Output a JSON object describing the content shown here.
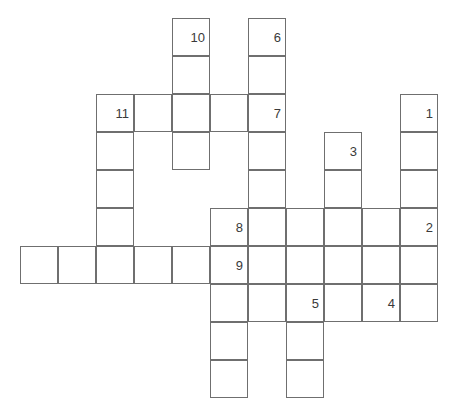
{
  "puzzle": {
    "type": "crossword-grid",
    "title": "",
    "cell_size": 38,
    "grid_origin": {
      "x": 20,
      "y": 18
    },
    "columns": 11,
    "rows": 9,
    "colors": {
      "cell_border": "#6f6f6f",
      "cell_fill": "#ffffff",
      "number_text": "#3a3a3a",
      "page_background": "#ffffff"
    },
    "clue_numbers": [
      1,
      2,
      3,
      4,
      5,
      6,
      7,
      8,
      9,
      10,
      11
    ],
    "entries": [
      {
        "number": 10,
        "direction": "down",
        "start": {
          "col": 4,
          "row": 0
        },
        "length": 4
      },
      {
        "number": 6,
        "direction": "down",
        "start": {
          "col": 6,
          "row": 0
        },
        "length": 5
      },
      {
        "number": 11,
        "direction": "across",
        "start": {
          "col": 2,
          "row": 2
        },
        "length": 5
      },
      {
        "number": 11,
        "direction": "down",
        "start": {
          "col": 2,
          "row": 2
        },
        "length": 5
      },
      {
        "number": 7,
        "direction": "across",
        "start": {
          "col": 6,
          "row": 2
        },
        "length": 1
      },
      {
        "number": 1,
        "direction": "down",
        "start": {
          "col": 10,
          "row": 2
        },
        "length": 6
      },
      {
        "number": 3,
        "direction": "down",
        "start": {
          "col": 8,
          "row": 3
        },
        "length": 5
      },
      {
        "number": 8,
        "direction": "across",
        "start": {
          "col": 5,
          "row": 5
        },
        "length": 6
      },
      {
        "number": 2,
        "direction": "across",
        "start": {
          "col": 10,
          "row": 5
        },
        "length": 1
      },
      {
        "number": 9,
        "direction": "across",
        "start": {
          "col": 0,
          "row": 6
        },
        "length": 11
      },
      {
        "number": 9,
        "direction": "down",
        "start": {
          "col": 5,
          "row": 6
        },
        "length": 4
      },
      {
        "number": 5,
        "direction": "across",
        "start": {
          "col": 7,
          "row": 7
        },
        "length": 3
      },
      {
        "number": 5,
        "direction": "down",
        "start": {
          "col": 7,
          "row": 7
        },
        "length": 4
      },
      {
        "number": 4,
        "direction": "across",
        "start": {
          "col": 9,
          "row": 7
        },
        "length": 1
      }
    ],
    "cells": [
      {
        "col": 4,
        "row": 0,
        "number": "10"
      },
      {
        "col": 6,
        "row": 0,
        "number": "6"
      },
      {
        "col": 4,
        "row": 1,
        "number": ""
      },
      {
        "col": 6,
        "row": 1,
        "number": ""
      },
      {
        "col": 2,
        "row": 2,
        "number": "11"
      },
      {
        "col": 3,
        "row": 2,
        "number": ""
      },
      {
        "col": 4,
        "row": 2,
        "number": ""
      },
      {
        "col": 5,
        "row": 2,
        "number": ""
      },
      {
        "col": 6,
        "row": 2,
        "number": "7"
      },
      {
        "col": 10,
        "row": 2,
        "number": "1"
      },
      {
        "col": 2,
        "row": 3,
        "number": ""
      },
      {
        "col": 4,
        "row": 3,
        "number": ""
      },
      {
        "col": 6,
        "row": 3,
        "number": ""
      },
      {
        "col": 8,
        "row": 3,
        "number": "3"
      },
      {
        "col": 10,
        "row": 3,
        "number": ""
      },
      {
        "col": 2,
        "row": 4,
        "number": ""
      },
      {
        "col": 6,
        "row": 4,
        "number": ""
      },
      {
        "col": 8,
        "row": 4,
        "number": ""
      },
      {
        "col": 10,
        "row": 4,
        "number": ""
      },
      {
        "col": 2,
        "row": 5,
        "number": ""
      },
      {
        "col": 5,
        "row": 5,
        "number": "8"
      },
      {
        "col": 6,
        "row": 5,
        "number": ""
      },
      {
        "col": 7,
        "row": 5,
        "number": ""
      },
      {
        "col": 8,
        "row": 5,
        "number": ""
      },
      {
        "col": 9,
        "row": 5,
        "number": ""
      },
      {
        "col": 10,
        "row": 5,
        "number": "2"
      },
      {
        "col": 0,
        "row": 6,
        "number": ""
      },
      {
        "col": 1,
        "row": 6,
        "number": ""
      },
      {
        "col": 2,
        "row": 6,
        "number": ""
      },
      {
        "col": 3,
        "row": 6,
        "number": ""
      },
      {
        "col": 4,
        "row": 6,
        "number": ""
      },
      {
        "col": 5,
        "row": 6,
        "number": "9"
      },
      {
        "col": 6,
        "row": 6,
        "number": ""
      },
      {
        "col": 7,
        "row": 6,
        "number": ""
      },
      {
        "col": 8,
        "row": 6,
        "number": ""
      },
      {
        "col": 9,
        "row": 6,
        "number": ""
      },
      {
        "col": 10,
        "row": 6,
        "number": ""
      },
      {
        "col": 5,
        "row": 7,
        "number": ""
      },
      {
        "col": 6,
        "row": 7,
        "number": ""
      },
      {
        "col": 7,
        "row": 7,
        "number": "5"
      },
      {
        "col": 8,
        "row": 7,
        "number": ""
      },
      {
        "col": 9,
        "row": 7,
        "number": "4"
      },
      {
        "col": 10,
        "row": 7,
        "number": ""
      },
      {
        "col": 5,
        "row": 8,
        "number": ""
      },
      {
        "col": 7,
        "row": 8,
        "number": ""
      },
      {
        "col": 5,
        "row": 9,
        "number": ""
      },
      {
        "col": 7,
        "row": 9,
        "number": ""
      }
    ]
  }
}
